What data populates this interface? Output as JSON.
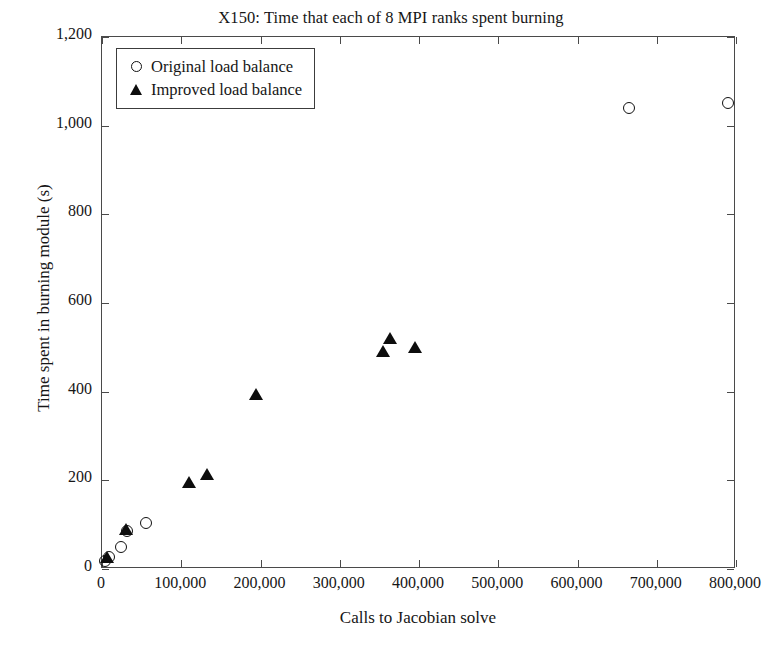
{
  "chart_data": {
    "type": "scatter",
    "title": "X150: Time that each of 8 MPI ranks spent burning",
    "xlabel": "Calls to Jacobian solve",
    "ylabel": "Time spent in burning module (s)",
    "xlim": [
      0,
      800000
    ],
    "ylim": [
      0,
      1200
    ],
    "grid": false,
    "legend_position": "upper-left",
    "xticks": [
      0,
      100000,
      200000,
      300000,
      400000,
      500000,
      600000,
      700000,
      800000
    ],
    "xticklabels": [
      "0",
      "100,000",
      "200,000",
      "300,000",
      "400,000",
      "500,000",
      "600,000",
      "700,000",
      "800,000"
    ],
    "yticks": [
      0,
      200,
      400,
      600,
      800,
      1000,
      1200
    ],
    "yticklabels": [
      "0",
      "200",
      "400",
      "600",
      "800",
      "1,000",
      "1,200"
    ],
    "series": [
      {
        "name": "Original load balance",
        "marker": "open-circle",
        "color": "#111111",
        "points": [
          {
            "x": 4000,
            "y": 18
          },
          {
            "x": 9000,
            "y": 28
          },
          {
            "x": 24000,
            "y": 50
          },
          {
            "x": 31000,
            "y": 86
          },
          {
            "x": 55000,
            "y": 103
          },
          {
            "x": 665000,
            "y": 1040
          },
          {
            "x": 790000,
            "y": 1051
          }
        ]
      },
      {
        "name": "Improved load balance",
        "marker": "filled-triangle",
        "color": "#0d0d0d",
        "points": [
          {
            "x": 6000,
            "y": 24
          },
          {
            "x": 30000,
            "y": 88
          },
          {
            "x": 110000,
            "y": 195
          },
          {
            "x": 132000,
            "y": 212
          },
          {
            "x": 194000,
            "y": 393
          },
          {
            "x": 355000,
            "y": 490
          },
          {
            "x": 363000,
            "y": 518
          },
          {
            "x": 395000,
            "y": 498
          }
        ]
      }
    ]
  }
}
